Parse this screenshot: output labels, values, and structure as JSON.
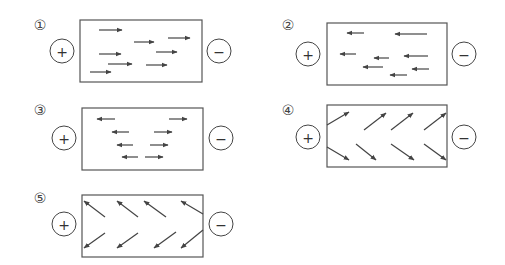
{
  "diagram": {
    "type": "electric-field-arrow-options",
    "panel_count": 5,
    "colors": {
      "stroke": "#444444",
      "background": "#ffffff"
    },
    "panels": [
      {
        "label": "①",
        "positive_sign": "+",
        "negative_sign": "−",
        "description": "all arrows point right (toward − terminal)",
        "box": [
          80,
          20,
          122,
          62
        ],
        "plus": [
          62,
          51
        ],
        "minus": [
          219,
          51
        ],
        "label_pos": [
          40,
          25
        ],
        "arrows": [
          [
            99,
            30,
            122,
            30
          ],
          [
            134,
            42,
            154,
            42
          ],
          [
            168,
            38,
            190,
            38
          ],
          [
            99,
            54,
            121,
            54
          ],
          [
            156,
            52,
            177,
            52
          ],
          [
            108,
            64,
            132,
            64
          ],
          [
            146,
            65,
            167,
            65
          ],
          [
            90,
            72,
            111,
            72
          ]
        ]
      },
      {
        "label": "②",
        "positive_sign": "+",
        "negative_sign": "−",
        "description": "all arrows point left (toward + terminal)",
        "box": [
          327,
          23,
          120,
          62
        ],
        "plus": [
          308,
          54
        ],
        "minus": [
          464,
          54
        ],
        "label_pos": [
          288,
          25
        ],
        "arrows": [
          [
            364,
            33,
            347,
            33
          ],
          [
            427,
            34,
            395,
            34
          ],
          [
            356,
            54,
            340,
            54
          ],
          [
            389,
            58,
            374,
            58
          ],
          [
            428,
            56,
            404,
            56
          ],
          [
            383,
            67,
            363,
            67
          ],
          [
            429,
            69,
            412,
            69
          ],
          [
            407,
            75,
            390,
            75
          ]
        ]
      },
      {
        "label": "③",
        "positive_sign": "+",
        "negative_sign": "−",
        "description": "upper-left arrows point left, right-side arrows point right",
        "box": [
          82,
          108,
          121,
          62
        ],
        "plus": [
          64,
          138
        ],
        "minus": [
          221,
          138
        ],
        "label_pos": [
          40,
          110
        ],
        "arrows": [
          [
            115,
            119,
            97,
            119
          ],
          [
            169,
            119,
            187,
            119
          ],
          [
            129,
            132,
            112,
            132
          ],
          [
            154,
            132,
            172,
            132
          ],
          [
            133,
            145,
            117,
            145
          ],
          [
            150,
            145,
            168,
            145
          ],
          [
            138,
            157,
            122,
            157
          ],
          [
            145,
            157,
            163,
            157
          ]
        ]
      },
      {
        "label": "④",
        "positive_sign": "+",
        "negative_sign": "−",
        "description": "upper-row arrows point up-right, lower-row arrows point down-right",
        "box": [
          327,
          105,
          120,
          62
        ],
        "plus": [
          308,
          137
        ],
        "minus": [
          464,
          137
        ],
        "label_pos": [
          288,
          110
        ],
        "arrows": [
          [
            327,
            125,
            349,
            112
          ],
          [
            364,
            130,
            386,
            113
          ],
          [
            391,
            130,
            413,
            113
          ],
          [
            424,
            130,
            446,
            113
          ],
          [
            327,
            147,
            349,
            160
          ],
          [
            356,
            144,
            376,
            160
          ],
          [
            391,
            144,
            414,
            160
          ],
          [
            424,
            144,
            446,
            160
          ]
        ]
      },
      {
        "label": "⑤",
        "positive_sign": "+",
        "negative_sign": "−",
        "description": "upper-row arrows point up-left, lower-row arrows point down-left",
        "box": [
          82,
          195,
          121,
          62
        ],
        "plus": [
          64,
          224
        ],
        "minus": [
          221,
          224
        ],
        "label_pos": [
          40,
          198
        ],
        "arrows": [
          [
            105,
            217,
            84,
            201
          ],
          [
            138,
            217,
            117,
            201
          ],
          [
            166,
            217,
            144,
            201
          ],
          [
            203,
            214,
            181,
            201
          ],
          [
            105,
            233,
            84,
            248
          ],
          [
            138,
            233,
            117,
            248
          ],
          [
            176,
            232,
            154,
            248
          ],
          [
            203,
            230,
            181,
            248
          ]
        ]
      }
    ]
  }
}
